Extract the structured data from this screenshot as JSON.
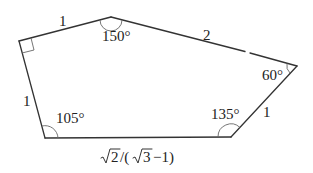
{
  "diagram": {
    "type": "pentagon",
    "vertices": {
      "A": {
        "x": 19,
        "y": 41,
        "angle_label": "",
        "right_angle": true
      },
      "B": {
        "x": 111,
        "y": 17,
        "angle_label": "150°"
      },
      "C": {
        "x": 297,
        "y": 66,
        "angle_label": "60°"
      },
      "D": {
        "x": 231,
        "y": 137,
        "angle_label": "135°"
      },
      "E": {
        "x": 45,
        "y": 138,
        "angle_label": "105°"
      }
    },
    "sides": {
      "AB": "1",
      "BC": "2",
      "CD": "1",
      "DE": "√2/(√3 −1)",
      "EA": "1"
    },
    "bottom_label": {
      "sqrt2": "2",
      "slash_open": "/(",
      "sqrt3": "3",
      "tail": "−1)"
    },
    "colors": {
      "stroke": "#333333",
      "arc": "#666666",
      "text": "#222222"
    }
  }
}
